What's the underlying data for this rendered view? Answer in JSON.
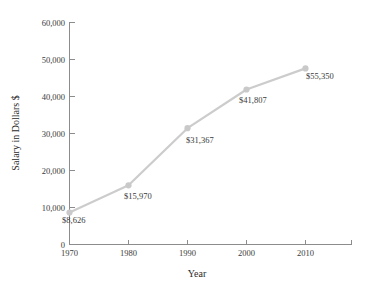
{
  "chart_data": {
    "type": "line",
    "title": "",
    "subtitle": "",
    "xlabel": "Year",
    "ylabel": "Salary in Dollars $",
    "x": [
      1970,
      1980,
      1990,
      2000,
      2010
    ],
    "categories": [
      "1970",
      "1980",
      "1990",
      "2000",
      "2010"
    ],
    "values": [
      8626,
      15970,
      31367,
      41807,
      55350
    ],
    "plotted_values": [
      8626,
      15970,
      31367,
      41807,
      47500
    ],
    "point_labels": [
      "$8,626",
      "$15,970",
      "$31,367",
      "$41,807",
      "$55,350"
    ],
    "xlim": [
      1970,
      2020
    ],
    "ylim": [
      0,
      60000
    ],
    "xticks": [
      1970,
      1980,
      1990,
      2000,
      2010,
      2020
    ],
    "xtick_labels": [
      "1970",
      "1980",
      "1990",
      "2000",
      "2010",
      ""
    ],
    "yticks": [
      0,
      10000,
      20000,
      30000,
      40000,
      50000,
      60000
    ],
    "ytick_labels": [
      "0",
      "10,000",
      "20,000",
      "30,000",
      "40,000",
      "50,000",
      "60,000"
    ],
    "grid": false,
    "legend": false,
    "legend_position": "none",
    "series": [
      {
        "name": "Salary",
        "values": [
          8626,
          15970,
          31367,
          41807,
          55350
        ]
      }
    ],
    "colors": {
      "line": "#cccccc",
      "marker": "#c9c9c9",
      "axis": "#8c8c8c",
      "text": "#3a3a3a",
      "background": "#ffffff"
    }
  },
  "axis": {
    "x_title": "Year",
    "y_title": "Salary in Dollars $"
  },
  "y_ticks": [
    {
      "label": "60,000",
      "value": 60000
    },
    {
      "label": "50,000",
      "value": 50000
    },
    {
      "label": "40,000",
      "value": 40000
    },
    {
      "label": "30,000",
      "value": 30000
    },
    {
      "label": "20,000",
      "value": 20000
    },
    {
      "label": "10,000",
      "value": 10000
    },
    {
      "label": "0",
      "value": 0
    }
  ],
  "x_ticks": [
    {
      "label": "1970",
      "value": 1970
    },
    {
      "label": "1980",
      "value": 1980
    },
    {
      "label": "1990",
      "value": 1990
    },
    {
      "label": "2000",
      "value": 2000
    },
    {
      "label": "2010",
      "value": 2010
    },
    {
      "label": "",
      "value": 2020
    }
  ],
  "points": [
    {
      "label": "$8,626",
      "year": "1970",
      "value": 8626
    },
    {
      "label": "$15,970",
      "year": "1980",
      "value": 15970
    },
    {
      "label": "$31,367",
      "year": "1990",
      "value": 31367
    },
    {
      "label": "$41,807",
      "year": "2000",
      "value": 41807
    },
    {
      "label": "$55,350",
      "year": "2010",
      "value": 55350
    }
  ]
}
